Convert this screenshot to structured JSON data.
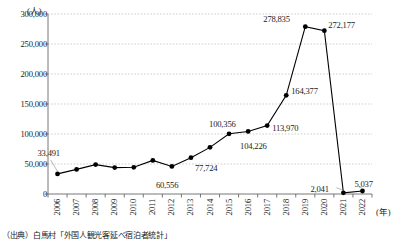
{
  "chart_data": {
    "type": "line",
    "title": "",
    "subtitle": "",
    "xlabel": "(年)",
    "ylabel": "(人)",
    "categories": [
      "2006",
      "2007",
      "2008",
      "2009",
      "2010",
      "2011",
      "2012",
      "2013",
      "2014",
      "2015",
      "2016",
      "2017",
      "2018",
      "2019",
      "2020",
      "2021",
      "2022"
    ],
    "values": [
      33491,
      41000,
      49000,
      44000,
      44500,
      56000,
      46000,
      60556,
      77724,
      100356,
      104226,
      113970,
      164377,
      278835,
      272177,
      2041,
      5037
    ],
    "point_labels": [
      {
        "category": "2006",
        "text": "33,491"
      },
      {
        "category": "2012",
        "text": "60,556"
      },
      {
        "category": "2013",
        "text": "77,724"
      },
      {
        "category": "2015",
        "text": "100,356"
      },
      {
        "category": "2016",
        "text": "104,226"
      },
      {
        "category": "2017",
        "text": "113,970"
      },
      {
        "category": "2018",
        "text": "164,377"
      },
      {
        "category": "2019",
        "text": "278,835"
      },
      {
        "category": "2020",
        "text": "272,177"
      },
      {
        "category": "2021",
        "text": "2,041"
      },
      {
        "category": "2022",
        "text": "5,037"
      }
    ],
    "ylim": [
      0,
      300000
    ],
    "yticks": [
      0,
      50000,
      100000,
      150000,
      200000,
      250000,
      300000
    ],
    "ytick_labels": [
      "0",
      "50,000",
      "100,000",
      "150,000",
      "200,000",
      "250,000",
      "300,000"
    ],
    "grid": true,
    "legend": "none",
    "series_color": "#000000",
    "grid_color": "#bbbbbb"
  },
  "axes": {
    "y_unit_label": "(人)",
    "x_unit_label": "(年)"
  },
  "source": {
    "text": "（出典）白馬村「外国人観光客延べ宿泊者統計」"
  }
}
